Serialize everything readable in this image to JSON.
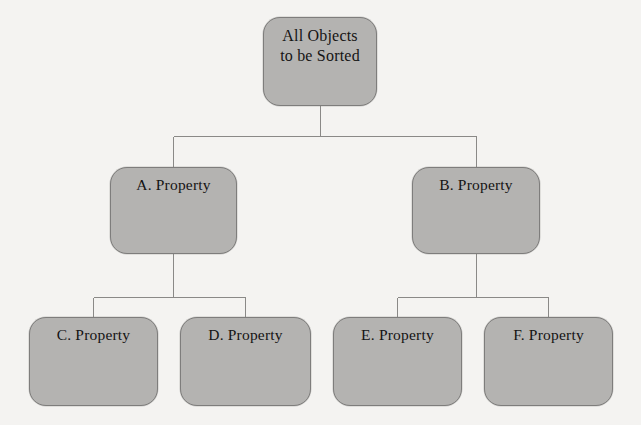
{
  "diagram": {
    "type": "tree",
    "background_color": "#f4f3f1",
    "node_fill_color": "#b4b3b1",
    "node_border_color": "#7e7d7c",
    "connector_color": "#8a8987",
    "text_color": "#141414",
    "nodes": [
      {
        "id": "root",
        "label": "All Objects\nto be Sorted",
        "level": 0,
        "x": 263,
        "y": 17,
        "width": 114,
        "height": 89
      },
      {
        "id": "a",
        "label": "A. Property",
        "level": 1,
        "x": 110,
        "y": 167,
        "width": 127,
        "height": 87
      },
      {
        "id": "b",
        "label": "B. Property",
        "level": 1,
        "x": 412,
        "y": 167,
        "width": 128,
        "height": 87
      },
      {
        "id": "c",
        "label": "C. Property",
        "level": 2,
        "x": 29,
        "y": 317,
        "width": 129,
        "height": 89
      },
      {
        "id": "d",
        "label": "D. Property",
        "level": 2,
        "x": 180,
        "y": 317,
        "width": 131,
        "height": 89
      },
      {
        "id": "e",
        "label": "E. Property",
        "level": 2,
        "x": 333,
        "y": 317,
        "width": 129,
        "height": 89
      },
      {
        "id": "f",
        "label": "F. Property",
        "level": 2,
        "x": 484,
        "y": 317,
        "width": 129,
        "height": 89
      }
    ],
    "edges": [
      {
        "id": "root-a",
        "from": "root",
        "to": "a"
      },
      {
        "id": "root-b",
        "from": "root",
        "to": "b"
      },
      {
        "id": "a-c",
        "from": "a",
        "to": "c"
      },
      {
        "id": "a-d",
        "from": "a",
        "to": "d"
      },
      {
        "id": "b-e",
        "from": "b",
        "to": "e"
      },
      {
        "id": "b-f",
        "from": "b",
        "to": "f"
      }
    ]
  }
}
